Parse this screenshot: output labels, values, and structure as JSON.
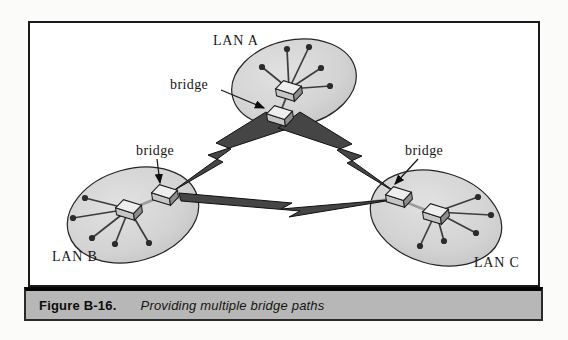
{
  "figure": {
    "caption_label": "Figure B-16.",
    "caption_text": "Providing multiple bridge paths"
  },
  "diagram": {
    "bridge_label": "bridge",
    "lans": [
      {
        "label": "LAN A",
        "stations": 5,
        "devices": [
          "hub",
          "bridge"
        ]
      },
      {
        "label": "LAN B",
        "stations": 5,
        "devices": [
          "hub",
          "bridge"
        ]
      },
      {
        "label": "LAN C",
        "stations": 5,
        "devices": [
          "hub",
          "bridge"
        ]
      }
    ],
    "links": [
      {
        "from": "LAN A",
        "to": "LAN B",
        "style": "lightning-bolt"
      },
      {
        "from": "LAN A",
        "to": "LAN C",
        "style": "lightning-bolt"
      },
      {
        "from": "LAN B",
        "to": "LAN C",
        "style": "lightning-bolt"
      }
    ],
    "colors": {
      "lan_fill": "#d3d3d3",
      "lan_stroke": "#242424",
      "bolt_fill": "#454545",
      "device_top": "#eeeeee",
      "device_front": "#c6c6c6",
      "device_side": "#8e8e8e",
      "caption_bar_bg": "#b7b7b7",
      "frame_stroke": "#1b1b1b"
    }
  }
}
